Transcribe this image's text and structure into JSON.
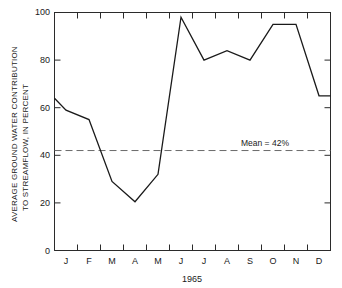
{
  "chart_data": {
    "type": "line",
    "title": "",
    "xlabel": "1965",
    "ylabel": "AVERAGE GROUND WATER CONTRIBUTION TO STREAMFLOW, IN PERCENT",
    "ylabel_line1": "AVERAGE GROUND WATER CONTRIBUTION",
    "ylabel_line2": "TO STREAMFLOW, IN PERCENT",
    "categories": [
      "J",
      "F",
      "M",
      "A",
      "M",
      "J",
      "J",
      "A",
      "S",
      "O",
      "N",
      "D"
    ],
    "category_names": [
      "January",
      "February",
      "March",
      "April",
      "May",
      "June",
      "July",
      "August",
      "September",
      "October",
      "November",
      "December"
    ],
    "values": [
      59,
      55,
      29,
      20.5,
      32,
      98,
      80,
      84,
      80,
      95,
      95,
      65
    ],
    "edge_start_value": 64,
    "series": [
      {
        "name": "Average ground water contribution to streamflow",
        "values": [
          59,
          55,
          29,
          20.5,
          32,
          98,
          80,
          84,
          80,
          95,
          95,
          65
        ]
      }
    ],
    "xlim": [
      0,
      12
    ],
    "ylim": [
      0,
      100
    ],
    "ytick_labels": [
      "0",
      "20",
      "40",
      "60",
      "80",
      "100"
    ],
    "ytick_values": [
      0,
      20,
      40,
      60,
      80,
      100
    ],
    "grid": false,
    "legend": false,
    "annotations": [
      {
        "name": "mean-line",
        "label": "Mean = 42%",
        "value": 42,
        "style": "dashed-horizontal"
      }
    ],
    "colors": {
      "data_line": "#1a1a1a",
      "mean_line": "#6b6b6b",
      "axis": "#2b2b2b",
      "background": "#ffffff"
    }
  }
}
